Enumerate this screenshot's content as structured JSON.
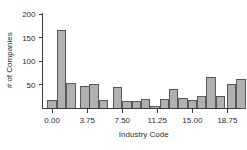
{
  "chart_data": {
    "type": "bar",
    "title": "",
    "subtitle": "",
    "xlabel": "Industry Code",
    "ylabel": "# of Companies",
    "xlim": [
      -0.6,
      20.2
    ],
    "ylim": [
      0,
      205
    ],
    "grid": false,
    "legend": null,
    "xticks": [
      "0.00",
      "3.75",
      "7.50",
      "11.25",
      "15.00",
      "18.75"
    ],
    "xtick_values": [
      0.0,
      3.75,
      7.5,
      11.25,
      15.0,
      18.75
    ],
    "yticks": [
      "50",
      "100",
      "150",
      "200"
    ],
    "ytick_values": [
      50,
      100,
      150,
      200
    ],
    "bar_width": 0.9,
    "bar_fill": "#b0b0b0",
    "bar_stroke": "#4a4a4a",
    "x": [
      0.0,
      1.0,
      2.0,
      3.5,
      4.5,
      5.5,
      7.0,
      8.0,
      9.0,
      10.0,
      11.0,
      12.0,
      13.0,
      14.0,
      15.0,
      16.0,
      17.0,
      18.0,
      19.2,
      20.2
    ],
    "categories": [
      "0",
      "1",
      "2",
      "3.5",
      "4.5",
      "5.5",
      "7",
      "8",
      "9",
      "10",
      "11",
      "12",
      "13",
      "14",
      "15",
      "16",
      "17",
      "18",
      "19.2",
      "20.2"
    ],
    "values": [
      18,
      166,
      53,
      47,
      51,
      17,
      45,
      14,
      15,
      19,
      4,
      19,
      41,
      22,
      18,
      25,
      66,
      26,
      52,
      62
    ]
  },
  "axes": {
    "y_title": "# of Companies",
    "x_title": "Industry Code"
  }
}
